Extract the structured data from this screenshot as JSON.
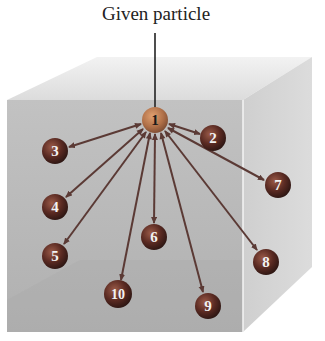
{
  "title": "Given particle",
  "colors": {
    "front_face": "#b9b9b9",
    "top_face": "#e8e8e8",
    "right_face": "#d2d2d2",
    "particle": "#6a2f24",
    "given_particle": "#b7774f",
    "arrow": "#5b3a35"
  },
  "given_particle": {
    "label": "1",
    "x": 155,
    "y": 120
  },
  "particles": [
    {
      "label": "2",
      "x": 213,
      "y": 138
    },
    {
      "label": "3",
      "x": 55,
      "y": 151
    },
    {
      "label": "4",
      "x": 55,
      "y": 207
    },
    {
      "label": "5",
      "x": 55,
      "y": 256
    },
    {
      "label": "6",
      "x": 154,
      "y": 237
    },
    {
      "label": "7",
      "x": 278,
      "y": 185
    },
    {
      "label": "8",
      "x": 266,
      "y": 262
    },
    {
      "label": "9",
      "x": 208,
      "y": 306
    },
    {
      "label": "10",
      "x": 118,
      "y": 294
    }
  ]
}
